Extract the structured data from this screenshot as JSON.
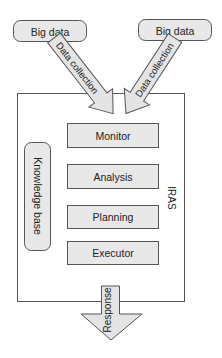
{
  "diagram": {
    "sources": [
      {
        "label": "Big data"
      },
      {
        "label": "Big data"
      }
    ],
    "input_arrows": [
      {
        "label": "Data collection"
      },
      {
        "label": "Data collection"
      }
    ],
    "system": {
      "label": "IRAS",
      "knowledge_base": "Knowledge base",
      "stages": [
        {
          "label": "Monitor"
        },
        {
          "label": "Analysis"
        },
        {
          "label": "Planning"
        },
        {
          "label": "Executor"
        }
      ]
    },
    "output_arrow": {
      "label": "Response"
    },
    "colors": {
      "box_fill": "#e8e8e8",
      "stroke": "#555555",
      "arrow_fill": "#e4e4e4",
      "text": "#222222"
    }
  }
}
